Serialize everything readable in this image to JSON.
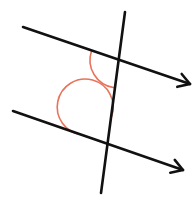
{
  "diagram": {
    "title": "Parallel lines cut by a transversal with marked angles",
    "canvas": {
      "width": 193,
      "height": 210,
      "background": "#ffffff"
    },
    "colors": {
      "line": "#111111",
      "angle_arc": "#e8735a"
    },
    "lines": [
      {
        "id": "parallel-line-top",
        "x1": 23,
        "y1": 27,
        "x2": 190,
        "y2": 84,
        "arrow": "end"
      },
      {
        "id": "parallel-line-bottom",
        "x1": 13,
        "y1": 111,
        "x2": 183,
        "y2": 170,
        "arrow": "end"
      },
      {
        "id": "transversal",
        "x1": 125,
        "y1": 12,
        "x2": 101,
        "y2": 193,
        "arrow": "none"
      }
    ],
    "angles": [
      {
        "id": "angle-top",
        "vertex": [
          118,
          60
        ],
        "position": "below-left",
        "radius": 28
      },
      {
        "id": "angle-bottom",
        "vertex": [
          108,
          144
        ],
        "position": "above-left",
        "radius": 28
      }
    ]
  }
}
